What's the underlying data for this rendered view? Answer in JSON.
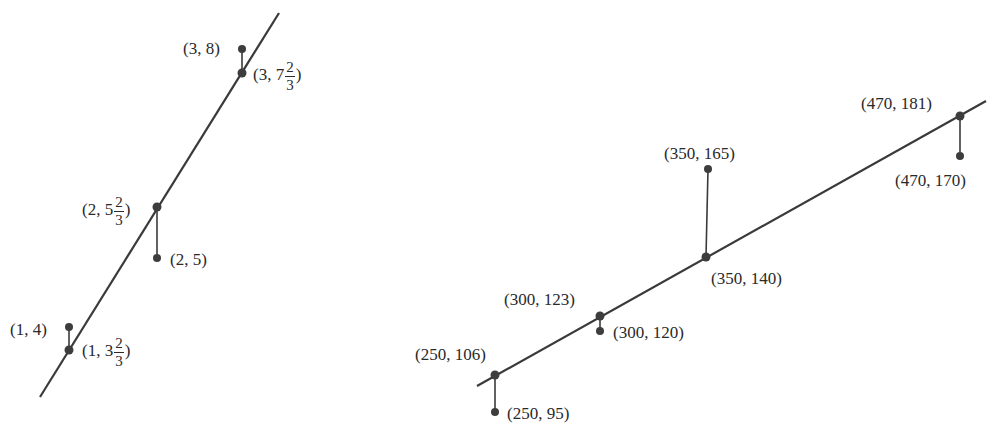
{
  "colors": {
    "line": "#3a3a3a",
    "point": "#3d3d3d",
    "text": "#2a2a2a",
    "background": "#ffffff"
  },
  "diagrams": [
    {
      "name": "left-regression",
      "line": {
        "x1": 279,
        "y1": 13,
        "x2": 40,
        "y2": 397
      },
      "points": [
        {
          "label": "(3, 8)",
          "x": 242,
          "y": 49,
          "type": "observed"
        },
        {
          "label_whole": "(3, 7",
          "label_num": "2",
          "label_den": "3",
          "label_end": ")",
          "x": 242,
          "y": 73,
          "type": "predicted"
        },
        {
          "label_whole": "(2, 5",
          "label_num": "2",
          "label_den": "3",
          "label_end": ")",
          "x": 157,
          "y": 207,
          "type": "predicted"
        },
        {
          "label": "(2, 5)",
          "x": 157,
          "y": 258,
          "type": "observed"
        },
        {
          "label": "(1, 4)",
          "x": 69,
          "y": 327,
          "type": "observed"
        },
        {
          "label_whole": "(1, 3",
          "label_num": "2",
          "label_den": "3",
          "label_end": ")",
          "x": 69,
          "y": 350,
          "type": "predicted"
        }
      ],
      "residuals": [
        {
          "x": 242,
          "y1": 49,
          "y2": 73
        },
        {
          "x": 157,
          "y1": 207,
          "y2": 258
        },
        {
          "x": 69,
          "y1": 327,
          "y2": 350
        }
      ]
    },
    {
      "name": "right-regression",
      "line": {
        "x1": 477,
        "y1": 386,
        "x2": 986,
        "y2": 101
      },
      "points": [
        {
          "label": "(470, 181)",
          "x": 960,
          "y": 116,
          "type": "predicted"
        },
        {
          "label": "(470, 170)",
          "x": 960,
          "y": 156,
          "type": "observed"
        },
        {
          "label": "(350, 165)",
          "x": 708,
          "y": 169,
          "type": "observed"
        },
        {
          "label": "(350, 140)",
          "x": 706,
          "y": 257,
          "type": "predicted"
        },
        {
          "label": "(300, 123)",
          "x": 600,
          "y": 316,
          "type": "predicted"
        },
        {
          "label": "(300, 120)",
          "x": 600,
          "y": 331,
          "type": "observed"
        },
        {
          "label": "(250, 106)",
          "x": 495,
          "y": 375,
          "type": "predicted"
        },
        {
          "label": "(250, 95)",
          "x": 495,
          "y": 412,
          "type": "observed"
        }
      ],
      "residuals": [
        {
          "x": 960,
          "y1": 116,
          "y2": 156
        },
        {
          "x": 707,
          "y1": 169,
          "y2": 257
        },
        {
          "x": 600,
          "y1": 316,
          "y2": 331
        },
        {
          "x": 495,
          "y1": 375,
          "y2": 412
        }
      ]
    }
  ],
  "labels": {
    "l_3_8": "(3, 8)",
    "l_3_7_whole": "(3, 7",
    "l_3_7_num": "2",
    "l_3_7_den": "3",
    "l_3_7_end": ")",
    "l_2_5f_whole": "(2, 5",
    "l_2_5f_num": "2",
    "l_2_5f_den": "3",
    "l_2_5f_end": ")",
    "l_2_5": "(2, 5)",
    "l_1_4": "(1, 4)",
    "l_1_3_whole": "(1, 3",
    "l_1_3_num": "2",
    "l_1_3_den": "3",
    "l_1_3_end": ")",
    "r_470_181": "(470, 181)",
    "r_470_170": "(470, 170)",
    "r_350_165": "(350, 165)",
    "r_350_140": "(350, 140)",
    "r_300_123": "(300, 123)",
    "r_300_120": "(300, 120)",
    "r_250_106": "(250, 106)",
    "r_250_95": "(250, 95)"
  }
}
